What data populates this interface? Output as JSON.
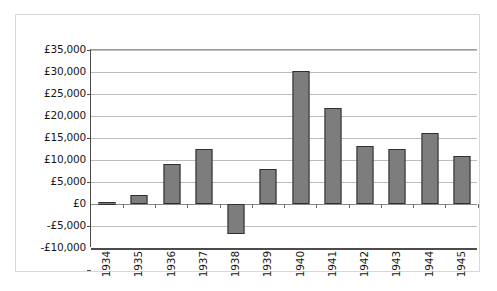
{
  "chart_data": {
    "type": "bar",
    "title": "",
    "xlabel": "",
    "ylabel": "",
    "categories": [
      "1934",
      "1935",
      "1936",
      "1937",
      "1938",
      "1939",
      "1940",
      "1941",
      "1942",
      "1943",
      "1944",
      "1945"
    ],
    "values": [
      500,
      2000,
      9000,
      12400,
      -6800,
      8000,
      30200,
      21800,
      13200,
      12600,
      16200,
      10800
    ],
    "ylim": [
      -10000,
      35000
    ],
    "ytick_values": [
      35000,
      30000,
      25000,
      20000,
      15000,
      10000,
      5000,
      0,
      -5000,
      -10000
    ],
    "ytick_labels": [
      "£35,000",
      "£30,000",
      "£25,000",
      "£20,000",
      "£15,000",
      "£10,000",
      "£5,000",
      "£0",
      "-£5,000",
      "-£10,000"
    ],
    "grid": true,
    "legend": "none",
    "currency_symbol": "£",
    "colors": {
      "bar_fill": "#7d7d7d",
      "bar_border": "#2f2f2f",
      "gridline": "#bdbdbd",
      "axis": "#4c4c4c",
      "frame": "#d8d8d8",
      "background": "#ffffff",
      "text": "#171717"
    }
  }
}
